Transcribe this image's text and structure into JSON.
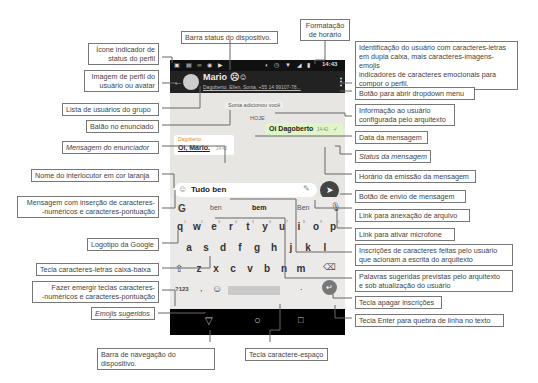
{
  "phone": {
    "status_bar": {
      "time": "14:43",
      "left_icons": [
        "image-icon",
        "message-icon",
        "voicemail-icon",
        "chrome-icon",
        "play-icon"
      ],
      "right_icons": [
        "data-saver-icon",
        "alarm-icon",
        "wifi-icon",
        "signal-icon",
        "battery-icon"
      ]
    },
    "app_bar": {
      "title": "Mario",
      "title_emojis": "☹☺",
      "subtitle": "Dagoberto, Ellen, Sonia, +55 14 99107-78..."
    },
    "chat": {
      "system_info": "Sonia adicionou você",
      "date": "HOJE",
      "outgoing": {
        "text": "Oi Dagoberto",
        "time": "14:42",
        "status": "✓"
      },
      "incoming": {
        "sender": "Dagoberto",
        "text": "Oi, Mário.",
        "time": "14:42"
      }
    },
    "composer": {
      "value": "Tudo ben",
      "send_icon": "➤"
    },
    "suggestions": [
      "ben",
      "bem",
      "Ben"
    ],
    "keyboard": {
      "row1": [
        "q",
        "w",
        "e",
        "r",
        "t",
        "y",
        "u",
        "i",
        "o",
        "p"
      ],
      "row1_hints": [
        "1",
        "2",
        "3",
        "4",
        "5",
        "6",
        "7",
        "8",
        "9",
        "0"
      ],
      "row2": [
        "a",
        "s",
        "d",
        "f",
        "g",
        "h",
        "j",
        "k",
        "l"
      ],
      "row3": [
        "z",
        "x",
        "c",
        "v",
        "b",
        "n",
        "m"
      ],
      "symbols_key": "?123",
      "comma": ",",
      "period": "."
    },
    "google_logo": "G"
  },
  "labels": {
    "status_icon": [
      "Ícone indicador de",
      "status do perfil"
    ],
    "avatar": [
      "Imagem de perfil do",
      "usuário ou avatar"
    ],
    "group_list": "Lista de usuários do grupo",
    "bubble": "Balão no enunciado",
    "sender_message": "Mensagem do enunciador",
    "interlocutor_name": "Nome do interlocutor em cor laranja",
    "message_chars": [
      "Mensagem com inserção de caracteres-",
      "-numéricos e  caracteres-pontuação"
    ],
    "google_logo": "Logotipo da Google",
    "lowercase_key": "Tecla caracteres-letras caixa-baixa",
    "symbols_key": [
      "Fazer emergir teclas caracteres-",
      "-numéricos e caracteres-pontuação"
    ],
    "emojis": "Emojis sugeridos",
    "nav_bar": "Barra de navegação do dispositivo.",
    "space_key": "Tecla caractere-espaço",
    "status_bar": "Barra status do dispositivo.",
    "time_format": [
      "Formatação",
      "de horário"
    ],
    "user_id": [
      "Identificação do usuário com caracteres-letras",
      "em dupla caixa, mais caracteres-imagens-emojis",
      "indicadores de caracteres emocionais para",
      "compor o perfil."
    ],
    "dropdown": "Botão para abrir dropdown menu",
    "info": [
      "Informação ao usuário",
      "configurada pelo arquitexto"
    ],
    "date": "Data da mensagem",
    "msg_status": "Status da mensagem",
    "msg_time": "Horário da emissão da mensagem",
    "send": "Botão de envio de mensagem",
    "attach": "Link para anexação de arquivo",
    "mic": "Link para ativar microfone",
    "inscriptions": [
      "Inscrições de  caracteres feitas pelo usuário",
      "que acionam a escrita do arquitexto"
    ],
    "suggested_words": [
      "Palavras sugeridas previstas pelo arquitexto",
      "e sob atualização do usuário"
    ],
    "backspace": "Tecla apagar inscrições",
    "enter": "Tecla Enter para quebra de linha no texto"
  }
}
